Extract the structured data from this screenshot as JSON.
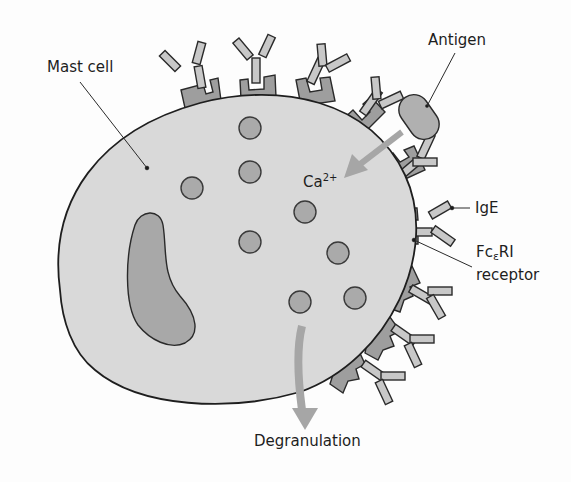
{
  "colors": {
    "background": "#fdfdfd",
    "cytoplasm": "#d9d9d9",
    "nucleus": "#a8a8a8",
    "granule": "#aaaaaa",
    "receptor": "#9e9e9e",
    "ige": "#c8c8c8",
    "antigen": "#b0b0b0",
    "arrow": "#a6a6a6",
    "outline": "#2a2a2a"
  },
  "labels": {
    "mast_cell": "Mast cell",
    "antigen": "Antigen",
    "calcium": {
      "base": "Ca",
      "superscript": "2+"
    },
    "ige": "IgE",
    "receptor": {
      "prefix": "Fc",
      "subscript": "ε",
      "suffix": "RI",
      "line2": "receptor"
    },
    "degranulation": "Degranulation"
  },
  "granules": [
    {
      "x": 250,
      "y": 128
    },
    {
      "x": 192,
      "y": 188
    },
    {
      "x": 250,
      "y": 172
    },
    {
      "x": 305,
      "y": 212
    },
    {
      "x": 250,
      "y": 242
    },
    {
      "x": 338,
      "y": 253
    },
    {
      "x": 300,
      "y": 302
    },
    {
      "x": 355,
      "y": 298
    }
  ]
}
